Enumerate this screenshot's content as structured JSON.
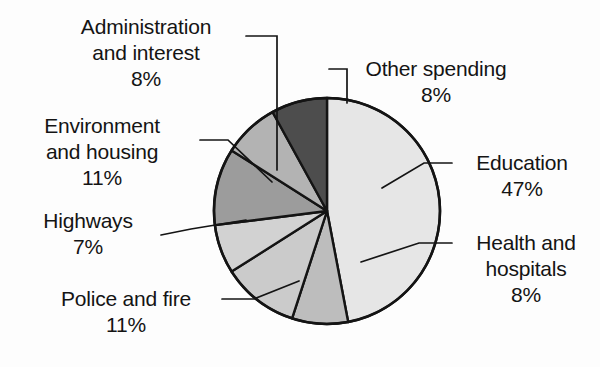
{
  "chart_data": {
    "type": "pie",
    "title": "",
    "subtitle": "",
    "xlabel": "",
    "ylabel": "",
    "legend_position": "none",
    "grid": false,
    "unit": "%",
    "start_angle_deg": 0,
    "direction": "clockwise",
    "center": {
      "x": 327,
      "y": 211
    },
    "radius": 113,
    "categories": [
      "Education",
      "Health and hospitals",
      "Police and fire",
      "Highways",
      "Environment and housing",
      "Administration and interest",
      "Other spending"
    ],
    "values": [
      47,
      8,
      11,
      7,
      11,
      8,
      8
    ],
    "slices": [
      {
        "name": "Education",
        "value": 47,
        "percent_label": "47%",
        "color": "#e6e6e6",
        "start_deg": 0,
        "end_deg": 169.2
      },
      {
        "name": "Health and hospitals",
        "value": 8,
        "percent_label": "8%",
        "color": "#bdbdbd",
        "start_deg": 169.2,
        "end_deg": 198.0
      },
      {
        "name": "Police and fire",
        "value": 11,
        "percent_label": "11%",
        "color": "#cbcbcb",
        "start_deg": 198.0,
        "end_deg": 237.6
      },
      {
        "name": "Highways",
        "value": 7,
        "percent_label": "7%",
        "color": "#d2d2d2",
        "start_deg": 237.6,
        "end_deg": 262.8
      },
      {
        "name": "Environment and housing",
        "value": 11,
        "percent_label": "11%",
        "color": "#9c9c9c",
        "start_deg": 262.8,
        "end_deg": 302.4
      },
      {
        "name": "Administration and interest",
        "value": 8,
        "percent_label": "8%",
        "color": "#b3b3b3",
        "start_deg": 302.4,
        "end_deg": 331.2
      },
      {
        "name": "Other spending",
        "value": 8,
        "percent_label": "8%",
        "color": "#4d4d4d",
        "start_deg": 331.2,
        "end_deg": 360.0
      }
    ]
  },
  "labels": {
    "administration": {
      "line1": "Administration",
      "line2": "and interest",
      "pct": "8%"
    },
    "environment": {
      "line1": "Environment",
      "line2": "and housing",
      "pct": "11%"
    },
    "highways": {
      "line1": "Highways",
      "pct": "7%"
    },
    "police": {
      "line1": "Police and fire",
      "pct": "11%"
    },
    "other": {
      "line1": "Other spending",
      "pct": "8%"
    },
    "education": {
      "line1": "Education",
      "pct": "47%"
    },
    "health": {
      "line1": "Health and",
      "line2": "hospitals",
      "pct": "8%"
    }
  },
  "style": {
    "outline_color": "#141414",
    "leader_color": "#141414",
    "text_color": "#141414",
    "background": "#fdfdfd"
  }
}
